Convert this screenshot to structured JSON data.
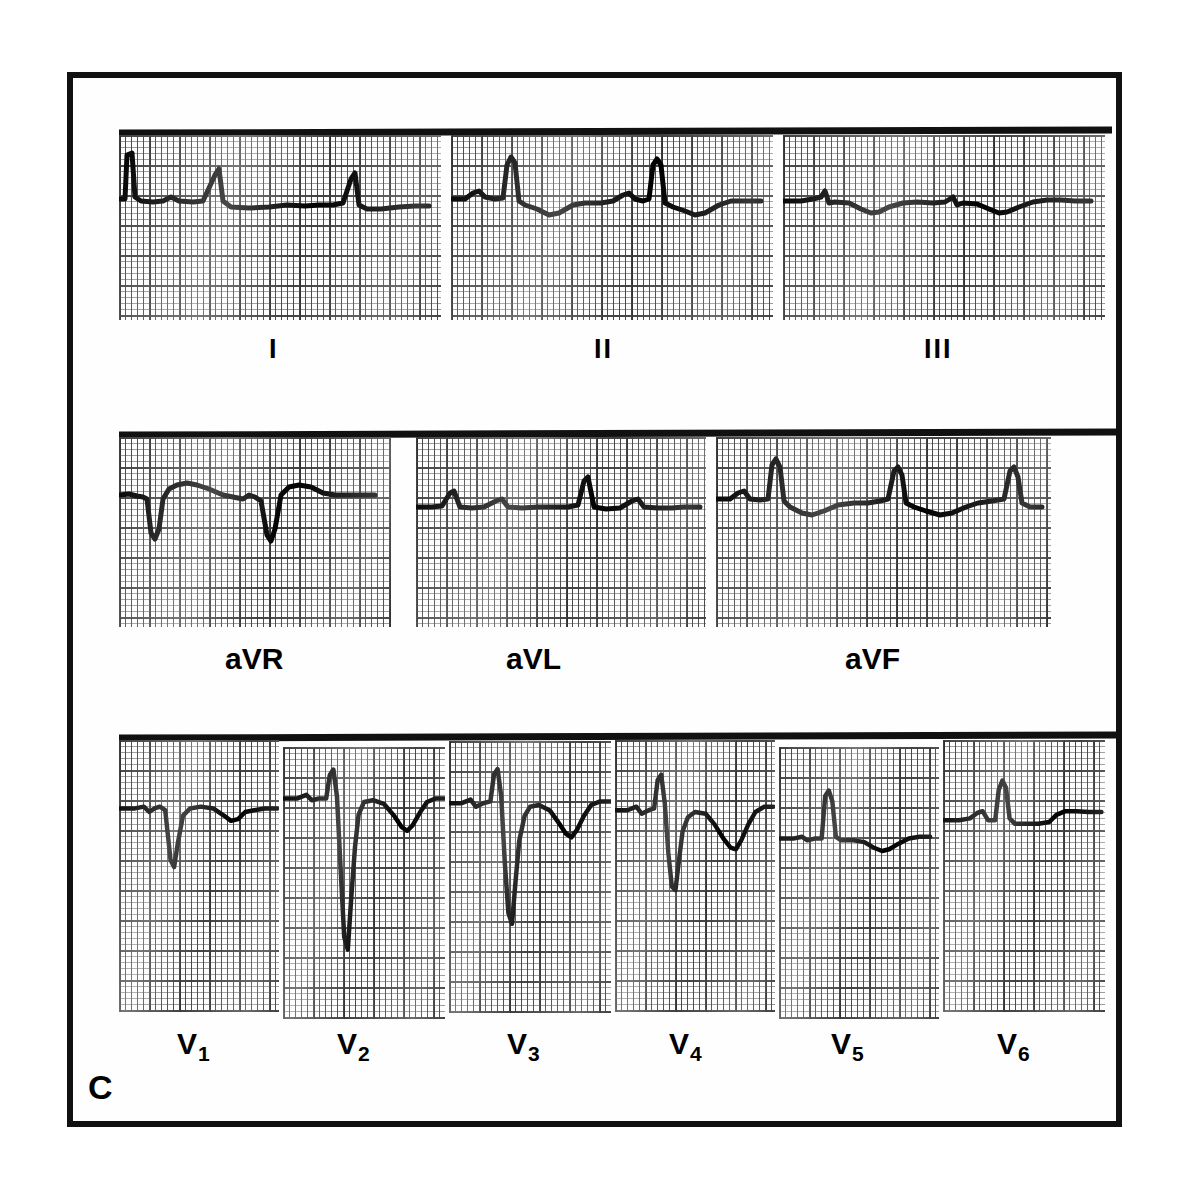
{
  "figure": {
    "panel_letter": "C",
    "type": "12-lead electrocardiogram",
    "background_color": "#ffffff",
    "trace_color": "#000000",
    "grid_color": "#202020",
    "frame_color": "#111111"
  },
  "rows": [
    {
      "name": "limb-leads",
      "leads": [
        {
          "id": "I",
          "label": "I",
          "label_sub": ""
        },
        {
          "id": "II",
          "label": "II",
          "label_sub": ""
        },
        {
          "id": "III",
          "label": "III",
          "label_sub": ""
        }
      ]
    },
    {
      "name": "augmented-leads",
      "leads": [
        {
          "id": "aVR",
          "label": "aVR",
          "label_sub": ""
        },
        {
          "id": "aVL",
          "label": "aVL",
          "label_sub": ""
        },
        {
          "id": "aVF",
          "label": "aVF",
          "label_sub": ""
        }
      ]
    },
    {
      "name": "precordial-leads",
      "leads": [
        {
          "id": "V1",
          "label": "V",
          "label_sub": "1"
        },
        {
          "id": "V2",
          "label": "V",
          "label_sub": "2"
        },
        {
          "id": "V3",
          "label": "V",
          "label_sub": "3"
        },
        {
          "id": "V4",
          "label": "V",
          "label_sub": "4"
        },
        {
          "id": "V5",
          "label": "V",
          "label_sub": "5"
        },
        {
          "id": "V6",
          "label": "V",
          "label_sub": "6"
        }
      ]
    }
  ],
  "chart_data": {
    "type": "line",
    "xlabel": "time",
    "ylabel": "voltage",
    "grid": true,
    "grid_small_mm": 1,
    "grid_large_mm": 5,
    "paper_speed": "25 mm/s",
    "calibration": "10 mm/mV",
    "series": [
      {
        "name": "I",
        "description": "calibration pulse then small upright R waves, flat low-amplitude ST segment, 3 beats",
        "baseline_y": 64,
        "points": "M0,64 L6,64 L8,20 L13,18 L16,62 L22,66 L34,67 L44,66 L52,62 L60,66 L74,67 L84,66 L96,40 L100,34 L104,66 L112,72 L130,73 L150,72 L168,70 L186,71 L200,70 L214,70 L224,68 L232,44 L236,38 L240,70 L248,74 L262,74 L280,72 L296,71 L310,71"
      },
      {
        "name": "II",
        "description": "P wave, tall R wave, ST depression with inverted T, 2 beats",
        "baseline_y": 64,
        "points": "M0,64 L14,64 L22,58 L28,56 L34,62 L44,64 L52,63 L56,30 L60,22 L64,28 L68,66 L74,70 L86,74 L98,80 L108,78 L122,70 L134,68 L150,68 L162,66 L172,60 L178,58 L184,64 L192,66 L198,64 L202,30 L206,24 L210,30 L214,68 L222,72 L234,76 L244,80 L254,78 L268,70 L280,66 L296,66 L310,66"
      },
      {
        "name": "III",
        "description": "very low amplitude, tiny R spikes, shallow negative T deflections",
        "baseline_y": 66,
        "points": "M0,66 L18,66 L30,64 L38,62 L42,56 L46,68 L52,67 L66,68 L78,74 L88,78 L96,77 L106,72 L120,68 L134,67 L150,68 L162,67 L170,62 L174,70 L180,68 L194,69 L206,74 L216,78 L224,77 L236,72 L250,67 L264,65 L278,65 L292,66 L308,66"
      },
      {
        "name": "aVR",
        "description": "deep negative QS complexes, positive ST-T hump between beats",
        "baseline_y": 58,
        "points": "M0,58 L10,57 L18,59 L24,60 L28,62 L32,96 L36,102 L40,92 L44,62 L50,52 L58,48 L68,46 L78,48 L90,52 L104,58 L114,60 L124,62 L130,58 L136,60 L142,64 L148,98 L152,104 L156,92 L162,58 L170,50 L180,48 L192,50 L204,56 L216,58 L230,58 L244,58 L256,58"
      },
      {
        "name": "aVL",
        "description": "small upright R waves on a nearly flat baseline, low voltage",
        "baseline_y": 70,
        "points": "M0,70 L16,70 L26,69 L34,56 L38,54 L44,70 L56,71 L68,70 L80,64 L86,62 L92,70 L106,71 L122,70 L136,70 L152,70 L162,68 L168,44 L172,40 L178,70 L190,72 L204,71 L216,64 L222,62 L228,70 L242,71 L256,71 L268,70 L284,70"
      },
      {
        "name": "aVF",
        "description": "tall narrow R waves, ST depression with negative T waves between beats",
        "baseline_y": 62,
        "points": "M0,62 L14,62 L22,56 L28,54 L34,62 L44,63 L52,62 L56,28 L60,22 L64,30 L68,64 L74,70 L86,76 L96,78 L108,74 L122,68 L138,66 L152,66 L164,64 L172,62 L178,34 L182,30 L186,38 L190,66 L198,70 L210,74 L224,78 L236,76 L250,70 L262,66 L276,64 L288,62 L294,34 L298,30 L302,40 L306,66 L314,70 L326,70"
      },
      {
        "name": "V1",
        "description": "rS pattern with deep S wave, shallow negative T wave",
        "baseline_y": 60,
        "points": "M0,60 L18,60 L28,58 L34,64 L40,60 L46,58 L52,62 L58,118 L62,126 L66,100 L72,68 L80,60 L92,58 L106,60 L118,68 L126,74 L134,72 L142,64 L152,62 L164,60 L178,60"
      },
      {
        "name": "V2",
        "description": "very tall R then extremely deep S below strip, broad inverted T wave",
        "baseline_y": 42,
        "points": "M0,42 L16,42 L26,38 L32,44 L40,42 L48,42 L52,16 L56,10 L60,40 L64,120 L68,196 L72,210 L76,150 L80,96 L84,60 L90,46 L100,44 L112,48 L124,62 L132,74 L138,78 L144,72 L152,58 L160,46 L170,42 L180,42"
      },
      {
        "name": "V3",
        "description": "tall narrow R, deep S, deep broad inverted T wave",
        "baseline_y": 54,
        "points": "M0,54 L14,54 L24,50 L30,58 L38,54 L46,52 L50,22 L54,16 L58,46 L62,120 L66,176 L70,188 L74,140 L78,96 L84,68 L90,58 L100,56 L112,62 L122,76 L130,88 L136,92 L142,84 L150,68 L158,56 L168,52 L180,52"
      },
      {
        "name": "V4",
        "description": "tall R wave, deep S, broad deeply inverted T wave",
        "baseline_y": 62,
        "points": "M0,62 L14,62 L24,58 L30,66 L38,62 L44,60 L48,28 L52,22 L56,54 L60,110 L64,148 L68,152 L72,118 L76,86 L82,70 L90,64 L102,66 L112,78 L122,94 L130,104 L136,106 L142,96 L150,78 L158,64 L168,58 L178,58"
      },
      {
        "name": "V5",
        "description": "tall narrow R wave, shallow negative T wave after the beat",
        "baseline_y": 86,
        "points": "M0,86 L16,86 L26,84 L32,88 L40,86 L48,86 L52,38 L56,32 L60,44 L64,84 L70,88 L84,88 L96,90 L106,96 L116,100 L124,98 L134,92 L146,86 L158,84 L170,84"
      },
      {
        "name": "V6",
        "description": "tall narrow R wave with upright T wave, isoelectric baseline",
        "baseline_y": 74,
        "points": "M0,74 L18,74 L30,72 L38,66 L44,64 L50,74 L58,74 L62,40 L66,30 L70,38 L74,72 L80,78 L92,78 L106,78 L118,76 L126,68 L136,64 L148,64 L162,65 L176,65"
      }
    ]
  }
}
